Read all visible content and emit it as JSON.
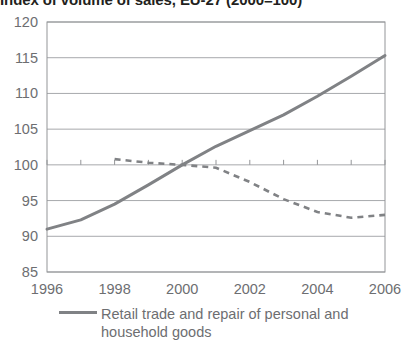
{
  "chart_data": {
    "type": "line",
    "title": "Index of volume of sales, EU-27 (2000=100)",
    "xlabel": "",
    "ylabel": "",
    "x": [
      1996,
      1997,
      1998,
      1999,
      2000,
      2001,
      2002,
      2003,
      2004,
      2005,
      2006
    ],
    "xlim": [
      1996,
      2006
    ],
    "ylim": [
      85,
      120
    ],
    "y_ticks": [
      85,
      90,
      95,
      100,
      105,
      110,
      115,
      120
    ],
    "x_ticks": [
      1996,
      1998,
      2000,
      2002,
      2004,
      2006
    ],
    "x_tick_labels": [
      "1996",
      "1998",
      "2000",
      "2002",
      "2004",
      "2006"
    ],
    "y_tick_labels": [
      "85",
      "90",
      "95",
      "100",
      "105",
      "110",
      "115",
      "120"
    ],
    "grid": "horizontal",
    "legend_position": "bottom-left",
    "series": [
      {
        "name": "Retail trade and repair of personal and household goods",
        "style": "solid",
        "color": "#808285",
        "x": [
          1996,
          1997,
          1998,
          1999,
          2000,
          2001,
          2002,
          2003,
          2004,
          2005,
          2006
        ],
        "values": [
          91.0,
          92.3,
          94.5,
          97.2,
          100.0,
          102.6,
          104.8,
          107.0,
          109.6,
          112.4,
          115.3
        ]
      },
      {
        "name": "",
        "style": "dashed",
        "color": "#808285",
        "x": [
          1998,
          1999,
          2000,
          2001,
          2002,
          2003,
          2004,
          2005,
          2006
        ],
        "values": [
          100.8,
          100.3,
          100.0,
          99.6,
          97.6,
          95.2,
          93.4,
          92.6,
          93.0
        ]
      }
    ]
  },
  "legend": {
    "entries": [
      {
        "label": "Retail trade and repair of personal and household goods"
      }
    ]
  }
}
